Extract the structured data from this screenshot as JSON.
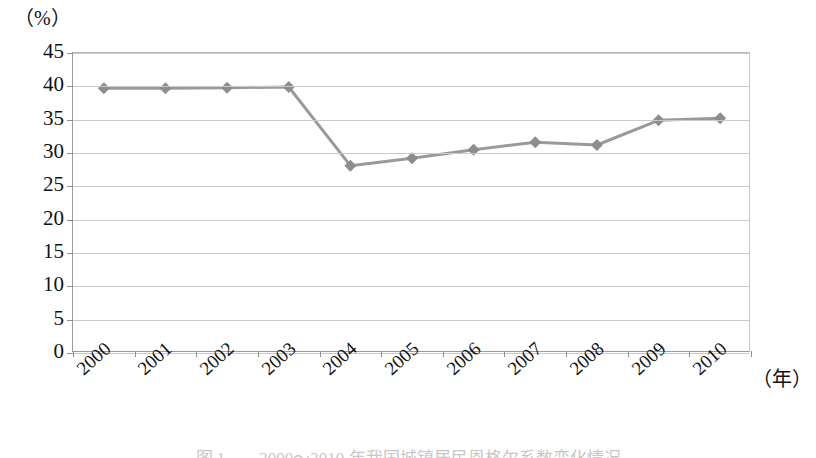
{
  "chart_data": {
    "type": "line",
    "title": "",
    "xlabel": "（年）",
    "ylabel": "（%）",
    "categories": [
      "2000",
      "2001",
      "2002",
      "2003",
      "2004",
      "2005",
      "2006",
      "2007",
      "2008",
      "2009",
      "2010"
    ],
    "values": [
      39.7,
      39.7,
      39.8,
      39.9,
      28.1,
      29.2,
      30.5,
      31.6,
      31.2,
      34.9,
      35.2
    ],
    "series": [
      {
        "name": "",
        "values": [
          39.7,
          39.7,
          39.8,
          39.9,
          28.1,
          29.2,
          30.5,
          31.6,
          31.2,
          34.9,
          35.2
        ]
      }
    ],
    "ylim": [
      0,
      45
    ],
    "y_ticks": [
      0,
      5,
      10,
      15,
      20,
      25,
      30,
      35,
      40,
      45
    ],
    "y_tick_labels": [
      "0",
      "5",
      "10",
      "15",
      "20",
      "25",
      "30",
      "35",
      "40",
      "45"
    ],
    "grid": true,
    "legend": "none",
    "marker": "diamond",
    "line_color": "#9a9a9a",
    "marker_color": "#8d8d8d",
    "gridline_color": "#c9c9c9",
    "axis_color": "#8e8e8e"
  },
  "axes": {
    "y_unit": "（%）",
    "x_unit": "（年）"
  },
  "caption": {
    "text": "图 1　　2000～2010 年我国城镇居民恩格尔系数变化情况"
  }
}
